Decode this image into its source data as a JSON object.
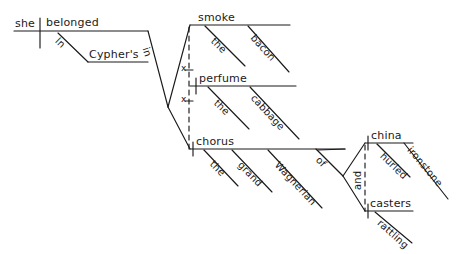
{
  "diagram": {
    "type": "reed-kellogg-sentence-diagram",
    "sentence": "In Cypher's she belonged in the smoke of bacon, the perfume of cabbage, and the grand Wagnerian chorus of hurled china and rattling casters ironstone",
    "ink_color": "#1a1a1a",
    "background_color": "#ffffff",
    "words": {
      "subject": "she",
      "verb": "belonged",
      "prep_in_opening": "In",
      "obj_cyphers": "Cypher's",
      "prep_in_main": "in",
      "conj_x_1": "x",
      "conj_x_2": "x",
      "noun_smoke": "smoke",
      "art_the_smoke": "the",
      "mod_bacon": "bacon",
      "noun_perfume": "perfume",
      "art_the_perfume": "the",
      "mod_cabbage": "cabbage",
      "noun_chorus": "chorus",
      "art_the_chorus": "the",
      "adj_grand": "grand",
      "adj_wagnerian": "Wagnerian",
      "prep_of": "of",
      "noun_china": "china",
      "mod_hurled": "hurled",
      "mod_ironstone": "ironstone",
      "conj_and": "and",
      "noun_casters": "casters",
      "mod_rattling": "rattling"
    }
  }
}
